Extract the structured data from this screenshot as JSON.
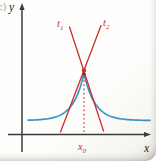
{
  "figure": {
    "panel_label": "(c)",
    "labels": {
      "y_axis": "y",
      "x_axis": "x",
      "t1": {
        "main": "t",
        "sub": "1"
      },
      "t2": {
        "main": "t",
        "sub": "2"
      },
      "x0": {
        "main": "x",
        "sub": "0"
      }
    },
    "colors": {
      "axis": "#3a3a3a",
      "curve": "#3a95c8",
      "tangent": "#cc2d26",
      "panel_label": "#7fa8bc",
      "text": "#222222",
      "peak_point": "#4a332e"
    },
    "geometry": {
      "axes": {
        "origin_x": 22,
        "x_axis_y": 134.5,
        "x_start": 8,
        "x_end": 146,
        "x_arrow_tip": 151,
        "y_start": 152,
        "y_end": 9,
        "y_arrow_tip": 3
      },
      "curve": {
        "peak_x": 84,
        "peak_y": 73.5,
        "baseline_y": 120.5,
        "tau": 11,
        "x_min": 28,
        "x_max": 150
      },
      "tangent1": {
        "x1": 69.5,
        "y1": 27,
        "x2": 103.5,
        "y2": 131
      },
      "tangent2": {
        "x1": 101,
        "y1": 25.5,
        "x2": 60.5,
        "y2": 132
      },
      "dotted": {
        "x": 84,
        "y1": 76,
        "y2": 132
      },
      "corner_point": {
        "x": 84,
        "y": 70.5,
        "r": 2.2
      },
      "peak_point": {
        "x": 84,
        "y": 73.8,
        "r": 1.4
      }
    }
  }
}
